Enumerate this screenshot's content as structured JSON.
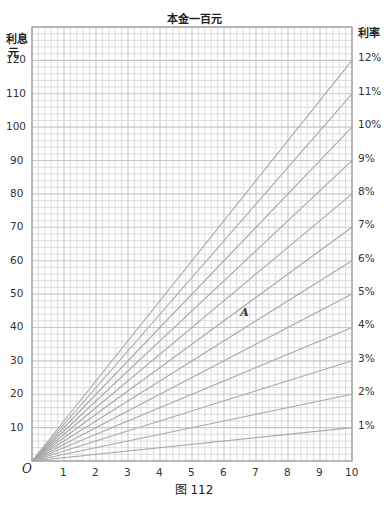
{
  "header": {
    "title": "本金一百元",
    "top_fragment": "18。 研 ……"
  },
  "axes": {
    "y_left_label_line1": "利息",
    "y_left_label_line2": "元",
    "y_right_label": "利率",
    "origin_label": "O"
  },
  "caption": "图 112",
  "annotation": {
    "label": "A",
    "x": 6.6,
    "y": 44
  },
  "chart_data": {
    "type": "line",
    "title": "本金一百元",
    "xlabel": "",
    "ylabel": "利息 元",
    "right_label": "利率",
    "xlim": [
      0,
      10
    ],
    "ylim": [
      0,
      130
    ],
    "grid": true,
    "x_ticks": [
      "1",
      "2",
      "3",
      "4",
      "5",
      "6",
      "7",
      "8",
      "9",
      "10"
    ],
    "y_ticks": [
      "10",
      "20",
      "30",
      "40",
      "50",
      "60",
      "70",
      "80",
      "90",
      "100",
      "110",
      "120"
    ],
    "series": [
      {
        "name": "1%",
        "x": [
          0,
          10
        ],
        "values": [
          0,
          10
        ]
      },
      {
        "name": "2%",
        "x": [
          0,
          10
        ],
        "values": [
          0,
          20
        ]
      },
      {
        "name": "3%",
        "x": [
          0,
          10
        ],
        "values": [
          0,
          30
        ]
      },
      {
        "name": "4%",
        "x": [
          0,
          10
        ],
        "values": [
          0,
          40
        ]
      },
      {
        "name": "5%",
        "x": [
          0,
          10
        ],
        "values": [
          0,
          50
        ]
      },
      {
        "name": "6%",
        "x": [
          0,
          10
        ],
        "values": [
          0,
          60
        ]
      },
      {
        "name": "7%",
        "x": [
          0,
          10
        ],
        "values": [
          0,
          70
        ]
      },
      {
        "name": "8%",
        "x": [
          0,
          10
        ],
        "values": [
          0,
          80
        ]
      },
      {
        "name": "9%",
        "x": [
          0,
          10
        ],
        "values": [
          0,
          90
        ]
      },
      {
        "name": "10%",
        "x": [
          0,
          10
        ],
        "values": [
          0,
          100
        ]
      },
      {
        "name": "11%",
        "x": [
          0,
          10
        ],
        "values": [
          0,
          110
        ]
      },
      {
        "name": "12%",
        "x": [
          0,
          10
        ],
        "values": [
          0,
          120
        ]
      }
    ],
    "annotations": [
      {
        "text": "A",
        "x": 6.6,
        "y": 44
      }
    ],
    "caption": "图 112"
  }
}
